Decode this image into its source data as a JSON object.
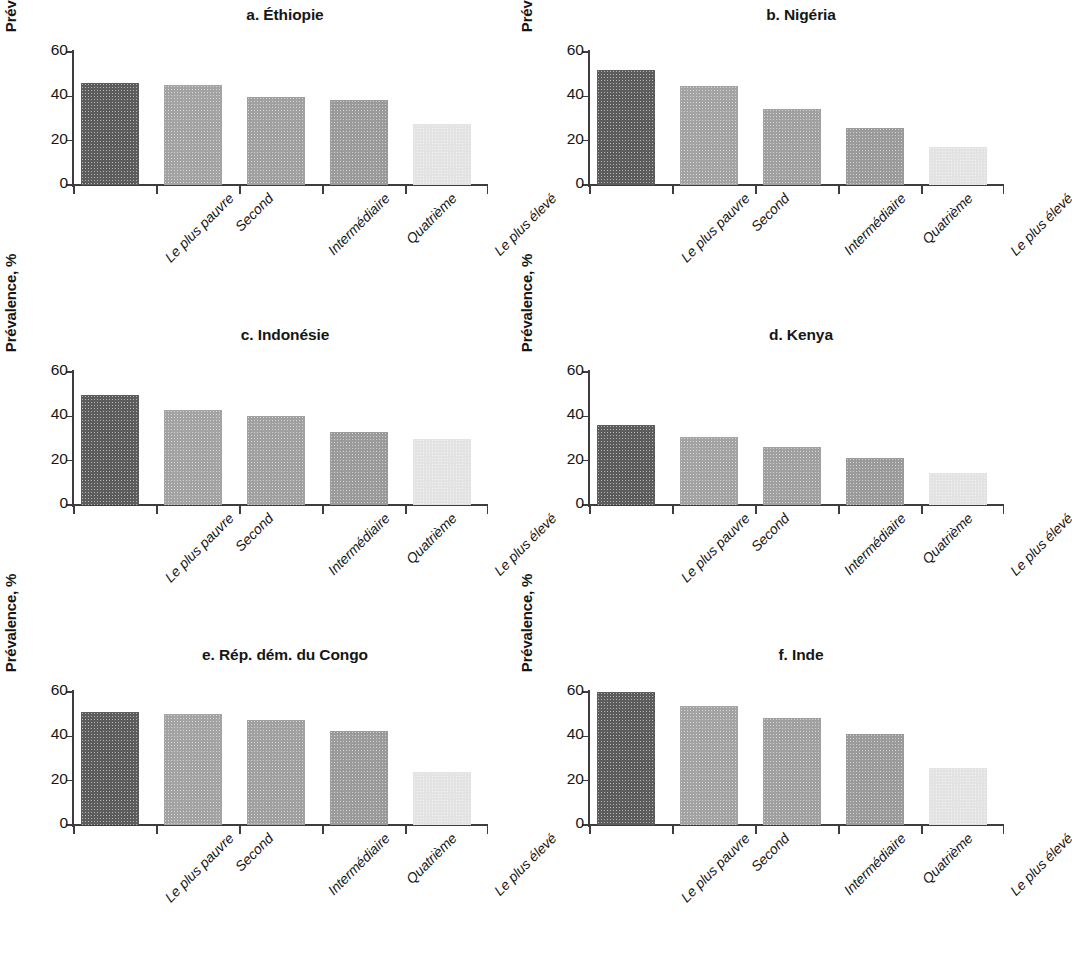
{
  "figure": {
    "panel_count": 6,
    "axis": {
      "y_label": "Prévalence, %",
      "y_ticks": [
        "0",
        "20",
        "40",
        "60"
      ],
      "y_min": 0,
      "y_max": 60
    },
    "categories": [
      "Le plus pauvre",
      "Second",
      "Intermédiaire",
      "Quatrième",
      "Le plus élevé"
    ],
    "bar_colors": [
      "#5c5c5c",
      "#a3a3a3",
      "#a0a0a0",
      "#9a9a9a",
      "#e3e3e3"
    ]
  },
  "chart_data": [
    {
      "type": "bar",
      "title": "a. Éthiopie",
      "panel_letter": "a.",
      "country": "Éthiopie",
      "categories": [
        "Le plus pauvre",
        "Second",
        "Intermédiaire",
        "Quatrième",
        "Le plus élevé"
      ],
      "values": [
        46,
        45,
        39.5,
        38.5,
        27.5
      ],
      "xlabel": "",
      "ylabel": "Prévalence, %",
      "ylim": [
        0,
        60
      ],
      "yticks": [
        0,
        20,
        40,
        60
      ],
      "grid": false,
      "legend": false
    },
    {
      "type": "bar",
      "title": "b. Nigéria",
      "panel_letter": "b.",
      "country": "Nigéria",
      "categories": [
        "Le plus pauvre",
        "Second",
        "Intermédiaire",
        "Quatrième",
        "Le plus élevé"
      ],
      "values": [
        52,
        44.5,
        34.5,
        25.5,
        17
      ],
      "xlabel": "",
      "ylabel": "Prévalence, %",
      "ylim": [
        0,
        60
      ],
      "yticks": [
        0,
        20,
        40,
        60
      ],
      "grid": false,
      "legend": false
    },
    {
      "type": "bar",
      "title": "c. Indonésie",
      "panel_letter": "c.",
      "country": "Indonésie",
      "categories": [
        "Le plus pauvre",
        "Second",
        "Intermédiaire",
        "Quatrième",
        "Le plus élevé"
      ],
      "values": [
        49.5,
        43,
        40,
        33,
        30
      ],
      "xlabel": "",
      "ylabel": "Prévalence, %",
      "ylim": [
        0,
        60
      ],
      "yticks": [
        0,
        20,
        40,
        60
      ],
      "grid": false,
      "legend": false
    },
    {
      "type": "bar",
      "title": "d. Kenya",
      "panel_letter": "d.",
      "country": "Kenya",
      "categories": [
        "Le plus pauvre",
        "Second",
        "Intermédiaire",
        "Quatrième",
        "Le plus élevé"
      ],
      "values": [
        36,
        30.5,
        26,
        21,
        14.5
      ],
      "xlabel": "",
      "ylabel": "Prévalence, %",
      "ylim": [
        0,
        60
      ],
      "yticks": [
        0,
        20,
        40,
        60
      ],
      "grid": false,
      "legend": false
    },
    {
      "type": "bar",
      "title": "e. Rép. dém. du Congo",
      "panel_letter": "e.",
      "country": "Rép. dém. du Congo",
      "categories": [
        "Le plus pauvre",
        "Second",
        "Intermédiaire",
        "Quatrième",
        "Le plus élevé"
      ],
      "values": [
        51,
        50,
        47.5,
        42.5,
        24
      ],
      "xlabel": "",
      "ylabel": "Prévalence, %",
      "ylim": [
        0,
        60
      ],
      "yticks": [
        0,
        20,
        40,
        60
      ],
      "grid": false,
      "legend": false
    },
    {
      "type": "bar",
      "title": "f. Inde",
      "panel_letter": "f.",
      "country": "Inde",
      "categories": [
        "Le plus pauvre",
        "Second",
        "Intermédiaire",
        "Quatrième",
        "Le plus élevé"
      ],
      "values": [
        60,
        53.5,
        48.5,
        41,
        25.5
      ],
      "xlabel": "",
      "ylabel": "Prévalence, %",
      "ylim": [
        0,
        60
      ],
      "yticks": [
        0,
        20,
        40,
        60
      ],
      "grid": false,
      "legend": false
    }
  ]
}
